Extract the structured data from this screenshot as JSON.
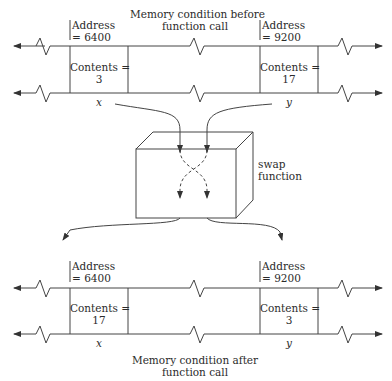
{
  "diagram": {
    "before": {
      "caption_line1": "Memory condition before",
      "caption_line2": "function call",
      "x_cell": {
        "address_label": "Address",
        "address_value": "= 6400",
        "contents_label": "Contents =",
        "contents_value": "3",
        "var_name": "x"
      },
      "y_cell": {
        "address_label": "Address",
        "address_value": "= 9200",
        "contents_label": "Contents =",
        "contents_value": "17",
        "var_name": "y"
      }
    },
    "function_box": {
      "label_line1": "swap",
      "label_line2": "function"
    },
    "after": {
      "caption_line1": "Memory condition after",
      "caption_line2": "function call",
      "x_cell": {
        "address_label": "Address",
        "address_value": "= 6400",
        "contents_label": "Contents =",
        "contents_value": "17",
        "var_name": "x"
      },
      "y_cell": {
        "address_label": "Address",
        "address_value": "= 9200",
        "contents_label": "Contents =",
        "contents_value": "3",
        "var_name": "y"
      }
    },
    "colors": {
      "line": "#333333",
      "text": "#2b2b2b",
      "background": "#ffffff"
    }
  }
}
